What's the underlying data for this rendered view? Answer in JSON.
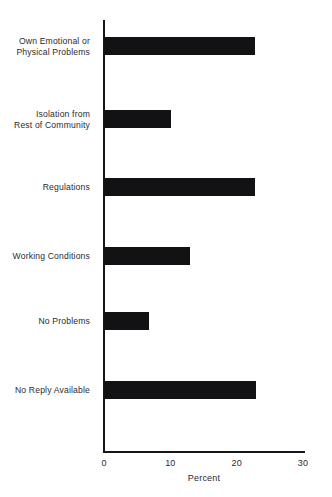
{
  "chart_data": {
    "type": "bar",
    "orientation": "horizontal",
    "title": "",
    "subtitle": "",
    "xlabel": "Percent",
    "ylabel": "",
    "categories": [
      "Own Emotional or\nPhysical Problems",
      "Isolation from\nRest of Community",
      "Regulations",
      "Working Conditions",
      "No Problems",
      "No Reply Available"
    ],
    "values": [
      22.8,
      10.1,
      22.8,
      13.0,
      6.8,
      22.9
    ],
    "xlim": [
      0,
      30
    ],
    "xticks": [
      0,
      10,
      20,
      30
    ],
    "xtick_labels": [
      "0",
      "10",
      "20",
      "30"
    ],
    "grid": false,
    "legend": null,
    "bar_color": "#121214",
    "axis_color": "#15161a",
    "background_color": "#ffffff",
    "text_color": "#2a2b2f"
  }
}
